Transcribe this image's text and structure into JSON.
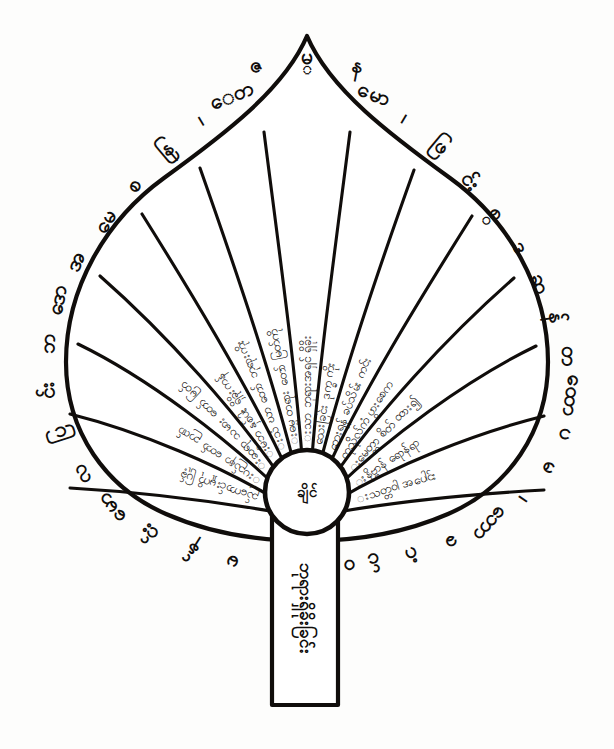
{
  "figure": {
    "medium": "black ink line drawing on white paper",
    "ink_color": "#100d0b",
    "paper_color": "#fdfdfc"
  },
  "hub": {
    "name": "central-circle",
    "text": "ချိင်"
  },
  "stem": {
    "name": "stem-panel",
    "text": "ဘုရားရှိခိုးခြင်း"
  },
  "leaf": {
    "apex_label": "pointed-apex",
    "segment_count": 13
  },
  "segments": [
    {
      "index": 1,
      "text": "းသာ ဘုရားအရှင် ရှိခိုး"
    },
    {
      "index": 2,
      "text": "းဓမ္မ တရား တော် မြတ်ကို"
    },
    {
      "index": 3,
      "text": "းသံ ဃာ တော် ဘုရားကိုး"
    },
    {
      "index": 4,
      "text": "းမိဘ နှစ်ပါး ရှိခိုးကန်"
    },
    {
      "index": 5,
      "text": "းဆရာ သမား တော် မြတ်"
    },
    {
      "index": 6,
      "text": "းပည်နာ တော် ဉာဏ်"
    },
    {
      "index": 7,
      "text": "ည်ကောင်းမှုကို ပြုခ့်"
    },
    {
      "index": 8,
      "text": "သေးခြင်း ဒုက္ခ ကိုး"
    },
    {
      "index": 9,
      "text": "ဘေးရန် ခပ်သိမ်း ကင်း"
    },
    {
      "index": 10,
      "text": "ကုသိုလ်ကံ ပွားစေက"
    },
    {
      "index": 11,
      "text": "းမေတ္တာ စိတ် ထား၍"
    },
    {
      "index": 12,
      "text": "းနိဗ္ဗာန် ရောန်ရာ"
    },
    {
      "index": 13,
      "text": "းသတ္တဝါ အပေါင်း"
    }
  ],
  "outer_ring": {
    "name": "outer-character-ring",
    "glyphs": [
      "မ္",
      "န",
      "မော",
      "၊",
      "ဖြ",
      "င်း",
      "စ္",
      "ဒ",
      "ဆ",
      "န်",
      "တ",
      "ထော",
      "ပ",
      "မ",
      "၊",
      "ဘော",
      "ခ",
      "ဂံ",
      "င်",
      "ဝ",
      "ဇ",
      "ေတ",
      "၊",
      "နြ",
      "စ",
      "မေ",
      "အ",
      "ဒော",
      "ဘ",
      "င်း",
      "ပြ",
      "လ"
    ]
  }
}
